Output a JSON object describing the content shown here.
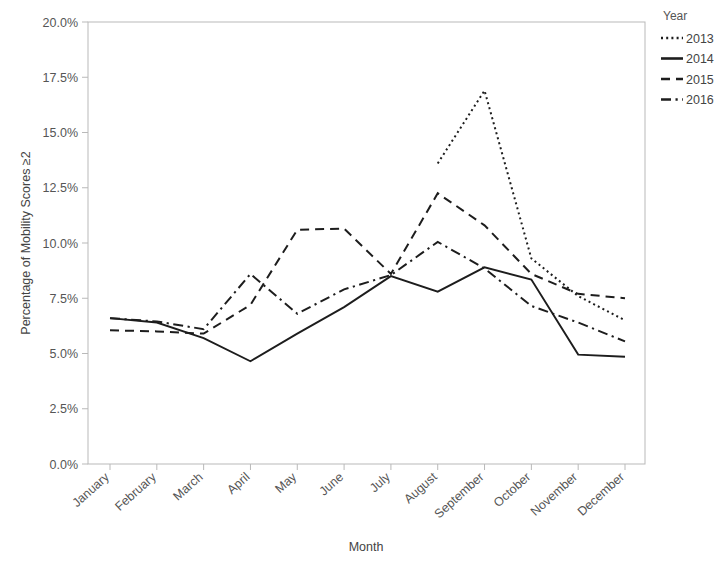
{
  "chart_data": {
    "type": "line",
    "title": "",
    "xlabel": "Month",
    "ylabel": "Percentage of Mobility Scores ≥2",
    "categories": [
      "January",
      "February",
      "March",
      "April",
      "May",
      "June",
      "July",
      "August",
      "September",
      "October",
      "November",
      "December"
    ],
    "xtick_labels": [
      "January",
      "February",
      "March",
      "April",
      "May",
      "June",
      "July",
      "August",
      "September",
      "October",
      "November",
      "December"
    ],
    "ytick_labels": [
      "0.0%",
      "2.5%",
      "5.0%",
      "7.5%",
      "10.0%",
      "12.5%",
      "15.0%",
      "17.5%",
      "20.0%"
    ],
    "ytick_values": [
      0,
      2.5,
      5,
      7.5,
      10,
      12.5,
      15,
      17.5,
      20
    ],
    "ylim": [
      0,
      20
    ],
    "yunit": "%",
    "grid": false,
    "legend_position": "right",
    "legend_title": "Year",
    "series": [
      {
        "name": "2013",
        "style": "dotted",
        "color": "#1d1d1d",
        "values": [
          null,
          null,
          null,
          null,
          null,
          null,
          null,
          13.6,
          16.9,
          9.3,
          7.6,
          6.5
        ]
      },
      {
        "name": "2014",
        "style": "solid",
        "color": "#1d1d1d",
        "values": [
          6.6,
          6.4,
          5.7,
          4.65,
          5.9,
          7.1,
          8.5,
          7.8,
          8.9,
          8.35,
          4.95,
          4.85
        ]
      },
      {
        "name": "2015",
        "style": "dashed",
        "color": "#1d1d1d",
        "values": [
          6.05,
          6.0,
          5.9,
          7.2,
          10.6,
          10.65,
          8.6,
          12.25,
          10.8,
          8.6,
          7.7,
          7.5
        ]
      },
      {
        "name": "2016",
        "style": "dashdot",
        "color": "#1d1d1d",
        "values": [
          6.6,
          6.45,
          6.1,
          8.6,
          6.8,
          7.9,
          8.55,
          10.05,
          8.85,
          7.15,
          6.4,
          5.55
        ]
      }
    ]
  },
  "legend": {
    "title": "Year",
    "entries": [
      {
        "label": "2013",
        "style": "dotted"
      },
      {
        "label": "2014",
        "style": "solid"
      },
      {
        "label": "2015",
        "style": "dashed"
      },
      {
        "label": "2016",
        "style": "dashdot"
      }
    ]
  },
  "axes": {
    "x_title": "Month",
    "y_title": "Percentage of Mobility Scores ≥2"
  }
}
